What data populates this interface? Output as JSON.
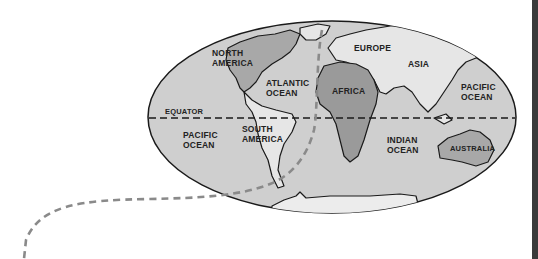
{
  "diagram": {
    "type": "world-map",
    "colors": {
      "ocean": "#cfcfcf",
      "land": "#e6e6e6",
      "highlight_land": "#9a9a9a",
      "outline": "#1a1a1a",
      "route": "#8a8a8a",
      "side_bar": "#3a3a3a"
    },
    "labels": {
      "north_america": "NORTH\nAMERICA",
      "north_america_l1": "NORTH",
      "north_america_l2": "AMERICA",
      "atlantic_l1": "ATLANTIC",
      "atlantic_l2": "OCEAN",
      "europe": "EUROPE",
      "asia": "ASIA",
      "africa": "AFRICA",
      "pacific_east_l1": "PACIFIC",
      "pacific_east_l2": "OCEAN",
      "equator": "EQUATOR",
      "pacific_west_l1": "PACIFIC",
      "pacific_west_l2": "OCEAN",
      "south_america_l1": "SOUTH",
      "south_america_l2": "AMERICA",
      "indian_l1": "INDIAN",
      "indian_l2": "OCEAN",
      "australia": "AUSTRALIA"
    }
  }
}
